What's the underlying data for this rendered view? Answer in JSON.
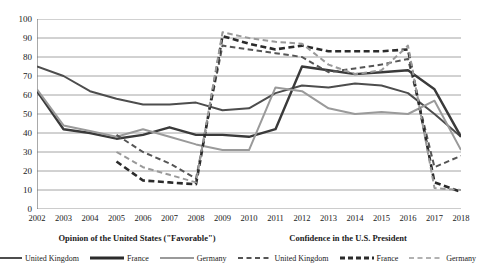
{
  "chart_data": {
    "type": "line",
    "title": "",
    "xlabel": "",
    "ylabel": "",
    "ylim": [
      0,
      100
    ],
    "ytick_step": 10,
    "grid": true,
    "legend_position": "bottom",
    "x": [
      2002,
      2003,
      2004,
      2005,
      2006,
      2007,
      2008,
      2009,
      2010,
      2011,
      2012,
      2013,
      2014,
      2015,
      2016,
      2017,
      2018
    ],
    "yticks": [
      0,
      10,
      20,
      30,
      40,
      50,
      60,
      70,
      80,
      90,
      100
    ],
    "series": [
      {
        "name": "United Kingdom",
        "group": "Opinion of the United States (\"Favorable\")",
        "style": "solid",
        "color": "#4d4d4d",
        "width": 2.0,
        "values": [
          75,
          70,
          62,
          58,
          55,
          55,
          56,
          52,
          53,
          61,
          65,
          64,
          66,
          65,
          61,
          50,
          38
        ]
      },
      {
        "name": "France",
        "group": "Opinion of the United States (\"Favorable\")",
        "style": "solid",
        "color": "#3a3a3a",
        "width": 2.4,
        "values": [
          62,
          42,
          40,
          37,
          39,
          43,
          39,
          39,
          38,
          42,
          75,
          73,
          71,
          72,
          73,
          63,
          38
        ]
      },
      {
        "name": "Germany",
        "group": "Opinion of the United States (\"Favorable\")",
        "style": "solid",
        "color": "#9a9a9a",
        "width": 2.0,
        "values": [
          63,
          44,
          41,
          38,
          42,
          38,
          34,
          31,
          31,
          64,
          62,
          53,
          50,
          51,
          50,
          57,
          31
        ]
      },
      {
        "name": "United Kingdom",
        "group": "Confidence in the U.S. President",
        "style": "dashed",
        "color": "#555555",
        "width": 2.0,
        "values": [
          null,
          null,
          null,
          39,
          30,
          24,
          16,
          86,
          84,
          82,
          80,
          72,
          74,
          76,
          79,
          22,
          28
        ]
      },
      {
        "name": "France",
        "group": "Confidence in the U.S. President",
        "style": "dashed",
        "color": "#2b2b2b",
        "width": 2.6,
        "values": [
          null,
          null,
          null,
          25,
          15,
          14,
          13,
          91,
          87,
          84,
          86,
          83,
          83,
          83,
          84,
          14,
          9
        ]
      },
      {
        "name": "Germany",
        "group": "Confidence in the U.S. President",
        "style": "dashed",
        "color": "#999999",
        "width": 2.0,
        "values": [
          null,
          null,
          null,
          30,
          22,
          18,
          14,
          93,
          90,
          88,
          87,
          76,
          71,
          73,
          86,
          11,
          10
        ]
      }
    ]
  },
  "legend": {
    "group_titles": [
      "Opinion of the United States (\"Favorable\")",
      "Confidence in the U.S. President"
    ],
    "items": [
      {
        "label": "United Kingdom",
        "style": "solid",
        "color": "#4d4d4d",
        "width": 2.0
      },
      {
        "label": "France",
        "style": "solid",
        "color": "#2b2b2b",
        "width": 3.0
      },
      {
        "label": "Germany",
        "style": "solid",
        "color": "#9a9a9a",
        "width": 2.0
      },
      {
        "label": "United Kingdom",
        "style": "dashed",
        "color": "#555555",
        "width": 2.0
      },
      {
        "label": "France",
        "style": "dashed",
        "color": "#2b2b2b",
        "width": 3.0
      },
      {
        "label": "Germany",
        "style": "dashed",
        "color": "#999999",
        "width": 1.6
      }
    ]
  },
  "axis": {
    "y_labels": [
      "100",
      "90",
      "80",
      "70",
      "60",
      "50",
      "40",
      "30",
      "20",
      "10",
      "0"
    ],
    "x_labels": [
      "2002",
      "2003",
      "2004",
      "2005",
      "2006",
      "2007",
      "2008",
      "2009",
      "2010",
      "2011",
      "2012",
      "2013",
      "2014",
      "2015",
      "2016",
      "2017",
      "2018"
    ]
  },
  "colors": {
    "grid": "#9a9a9a",
    "axis": "#6f6f6f",
    "background": "#ffffff",
    "text": "#1a1a1a"
  }
}
